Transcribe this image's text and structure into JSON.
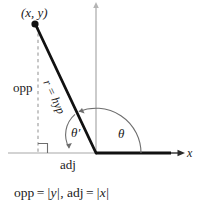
{
  "figure": {
    "point_label": "(x, y)",
    "opposite_label": "opp",
    "adjacent_label": "adj",
    "hypotenuse_label": "r = hyp",
    "angle_label": "θ",
    "reference_angle_label": "θ′",
    "x_axis_label": "x",
    "caption": {
      "opp_name": "opp",
      "opp_equals": "=",
      "opp_value": "y",
      "separator": ",",
      "adj_name": "adj",
      "adj_equals": "=",
      "adj_value": "x",
      "full_text": "opp = |y|, adj = |x|"
    }
  },
  "geometry": {
    "origin_x": 96,
    "origin_y": 153,
    "point_x": 35,
    "point_y": 24,
    "x_axis_start": 8,
    "x_axis_end": 180,
    "y_axis_top": 3,
    "terminal_ray_end": 170,
    "dashed_line_x": 38
  },
  "colors": {
    "stroke_dark": "#111111",
    "axis_gray": "#a8a8a8",
    "dashed_gray": "#9a9a9a",
    "arc_gray": "#6e6e6e",
    "text": "#1a1a1a",
    "background": "#ffffff"
  }
}
